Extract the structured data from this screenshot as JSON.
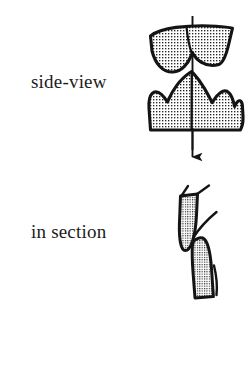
{
  "figure": {
    "background_color": "#ffffff",
    "ink_color": "#141414",
    "stipple_color": "#242424",
    "width": 250,
    "height": 371,
    "caption_font_size_px": 19
  },
  "labels": {
    "side_view": "side-view",
    "in_section": "in section"
  },
  "panels": [
    {
      "id": "side-view",
      "label": "side-view",
      "description": "Upper and lower cheek teeth shown in side view, occluding along a vertical axis",
      "parts": [
        {
          "name": "upper-tooth",
          "fill": "stipple",
          "outline": "thick-black"
        },
        {
          "name": "lower-tooth",
          "fill": "stipple",
          "outline": "thick-black"
        },
        {
          "name": "occlusion-axis-arrow",
          "direction": "down",
          "color": "#141414"
        }
      ]
    },
    {
      "id": "in-section",
      "label": "in section",
      "description": "The same two teeth cut in cross-section, each a tapered cone with thin enamel blade extensions",
      "parts": [
        {
          "name": "upper-tooth-section",
          "fill": "stipple",
          "outline": "thick-black"
        },
        {
          "name": "lower-tooth-section",
          "fill": "stipple",
          "outline": "thick-black"
        },
        {
          "name": "enamel-blade-lines",
          "count": 4,
          "color": "#141414"
        }
      ]
    }
  ],
  "icons": {
    "arrow": "down-arrow-icon"
  }
}
